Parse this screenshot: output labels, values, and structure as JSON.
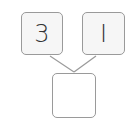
{
  "diagram": {
    "type": "number-bond",
    "parts": [
      {
        "label": "3"
      },
      {
        "label": "I"
      }
    ],
    "whole": {
      "label": ""
    }
  },
  "colors": {
    "border": "#9a9a9a",
    "box_fill": "#f6f6f6",
    "text": "#333333",
    "line": "#9a9a9a"
  }
}
